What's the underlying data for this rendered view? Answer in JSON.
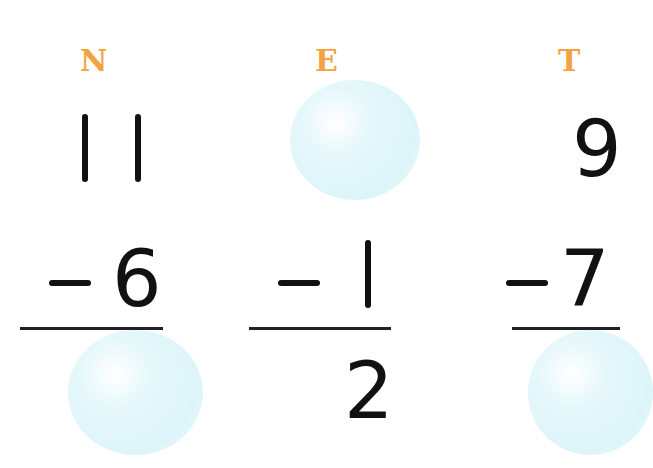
{
  "worksheet": {
    "problems": [
      {
        "letter": "N",
        "minuend": "11",
        "operator": "−",
        "subtrahend": "6",
        "answer": ""
      },
      {
        "letter": "E",
        "minuend": "",
        "operator": "−",
        "subtrahend": "1",
        "answer": "2"
      },
      {
        "letter": "T",
        "minuend": "9",
        "operator": "−",
        "subtrahend": "7",
        "answer": ""
      }
    ],
    "colors": {
      "letter": "#f5a243",
      "ink": "#111111",
      "bubble": "#d4f2f8"
    }
  }
}
